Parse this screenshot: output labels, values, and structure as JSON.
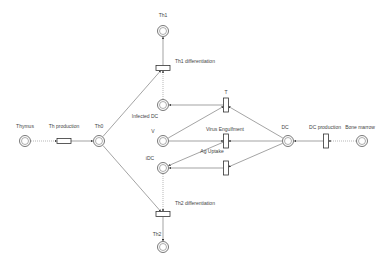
{
  "diagram": {
    "type": "petri-net",
    "places": [
      {
        "id": "thymus",
        "label": "Thymus",
        "x": 25,
        "y": 141,
        "lx": 25,
        "ly": 124
      },
      {
        "id": "th0",
        "label": "Th0",
        "x": 99,
        "y": 141,
        "lx": 99,
        "ly": 124
      },
      {
        "id": "th1",
        "label": "Th1",
        "x": 163,
        "y": 31,
        "lx": 163,
        "ly": 13
      },
      {
        "id": "th2",
        "label": "Th2",
        "x": 163,
        "y": 247,
        "lx": 157,
        "ly": 232
      },
      {
        "id": "infected_dc",
        "label": "Infected DC",
        "x": 163,
        "y": 105,
        "lx": 145,
        "ly": 114
      },
      {
        "id": "v",
        "label": "V",
        "x": 163,
        "y": 141,
        "lx": 153,
        "ly": 129
      },
      {
        "id": "idc",
        "label": "iDC",
        "x": 163,
        "y": 168,
        "lx": 150,
        "ly": 156
      },
      {
        "id": "dc",
        "label": "DC",
        "x": 288,
        "y": 141,
        "lx": 285,
        "ly": 125
      },
      {
        "id": "bone_marrow",
        "label": "Bone marrow",
        "x": 362,
        "y": 141,
        "lx": 360,
        "ly": 125
      }
    ],
    "transitions": [
      {
        "id": "th_production",
        "label": "Th production",
        "x": 64,
        "y": 141,
        "orient": "h",
        "lx": 64,
        "ly": 124
      },
      {
        "id": "th1_diff",
        "label": "Th1 differentiation",
        "x": 163,
        "y": 68,
        "orient": "h",
        "lx": 175,
        "ly": 59,
        "align": "left"
      },
      {
        "id": "th2_diff",
        "label": "Th2 differentiation",
        "x": 163,
        "y": 214,
        "orient": "h",
        "lx": 175,
        "ly": 201,
        "align": "left"
      },
      {
        "id": "t",
        "label": "T",
        "x": 226,
        "y": 105,
        "orient": "v",
        "lx": 226,
        "ly": 90
      },
      {
        "id": "virus_engulfment",
        "label": "Virus Engulfment",
        "x": 226,
        "y": 141,
        "orient": "v",
        "lx": 225,
        "ly": 127
      },
      {
        "id": "ag_uptake",
        "label": "Ag Uptake",
        "x": 226,
        "y": 168,
        "orient": "v",
        "lx": 212,
        "ly": 149
      },
      {
        "id": "dc_production",
        "label": "DC production",
        "x": 326,
        "y": 141,
        "orient": "v",
        "lx": 325,
        "ly": 125
      }
    ],
    "arcs": [
      {
        "from": "thymus",
        "to": "th_production",
        "style": "dotted"
      },
      {
        "from": "th_production",
        "to": "th0",
        "style": "solid"
      },
      {
        "from": "th0",
        "to": "th1_diff",
        "style": "solid"
      },
      {
        "from": "th0",
        "to": "th2_diff",
        "style": "solid"
      },
      {
        "from": "infected_dc",
        "to": "th1_diff",
        "style": "dotted"
      },
      {
        "from": "idc",
        "to": "th2_diff",
        "style": "dotted"
      },
      {
        "from": "th1_diff",
        "to": "th1",
        "style": "solid"
      },
      {
        "from": "th2_diff",
        "to": "th2",
        "style": "solid"
      },
      {
        "from": "t",
        "to": "infected_dc",
        "style": "solid"
      },
      {
        "from": "v",
        "to": "t",
        "style": "solid"
      },
      {
        "from": "dc",
        "to": "t",
        "style": "solid"
      },
      {
        "from": "v",
        "to": "virus_engulfment",
        "style": "solid"
      },
      {
        "from": "dc",
        "to": "virus_engulfment",
        "style": "solid"
      },
      {
        "from": "virus_engulfment",
        "to": "idc",
        "style": "solid"
      },
      {
        "from": "dc",
        "to": "ag_uptake",
        "style": "solid"
      },
      {
        "from": "ag_uptake",
        "to": "idc",
        "style": "solid"
      },
      {
        "from": "dc_production",
        "to": "dc",
        "style": "solid"
      },
      {
        "from": "bone_marrow",
        "to": "dc_production",
        "style": "dotted"
      }
    ]
  }
}
